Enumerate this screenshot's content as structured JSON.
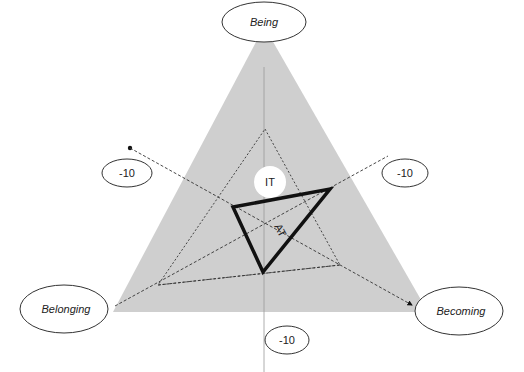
{
  "diagram": {
    "vertices": {
      "top": "Being",
      "left": "Belonging",
      "right": "Becoming"
    },
    "axis_labels": {
      "left": "-10",
      "right": "-10",
      "bottom": "-10"
    },
    "inner_labels": {
      "it": "IT",
      "at": "AT"
    },
    "colors": {
      "triangle_fill": "#cfcfcf",
      "line": "#111111",
      "ellipse_fill": "#ffffff",
      "ellipse_stroke": "#333333"
    }
  }
}
